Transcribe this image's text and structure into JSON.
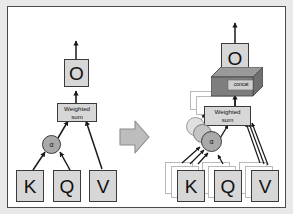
{
  "figure": {
    "colors": {
      "page_background": "#e9e9e9",
      "canvas_background": "#ffffff",
      "canvas_border": "#4a4a4a",
      "box_fill": "#d7d7d7",
      "box_stroke": "#3b3b3b",
      "ghost_stroke": "#b9b9b9",
      "circle_front_fill": "#a9a9a9",
      "circle_mid_fill": "#c4c4c4",
      "circle_back_fill": "#dcdcdc",
      "concat_top_fill": "#9a9a9a",
      "concat_side_fill": "#707070",
      "concat_front_fill": "#c9c9c9",
      "transition_arrow_fill": "#bdbdbd",
      "arrow_stroke": "#1a1a1a"
    }
  },
  "left_diagram": {
    "name": "single-head-attention",
    "output_box": {
      "label": "O"
    },
    "weighted_sum_box": {
      "line1": "Weighted",
      "line2": "sum"
    },
    "attention_node": {
      "label": "α"
    },
    "input_boxes": [
      {
        "label": "K"
      },
      {
        "label": "Q"
      },
      {
        "label": "V"
      }
    ],
    "output_arrow": {
      "label": "output-arrow"
    }
  },
  "transition": {
    "name": "transition-arrow",
    "direction": "right"
  },
  "right_diagram": {
    "name": "multi-head-attention",
    "output_box": {
      "label": "O"
    },
    "concat_box": {
      "label": "concat"
    },
    "weighted_sum_box": {
      "line1": "Weighted",
      "line2": "sum"
    },
    "weighted_sum_stack_count": 3,
    "attention_node": {
      "label": "α"
    },
    "attention_node_stack_count": 3,
    "input_boxes": [
      {
        "label": "K",
        "stack_count": 3
      },
      {
        "label": "Q",
        "stack_count": 3
      },
      {
        "label": "V",
        "stack_count": 3
      }
    ],
    "output_arrow": {
      "label": "output-arrow"
    }
  }
}
